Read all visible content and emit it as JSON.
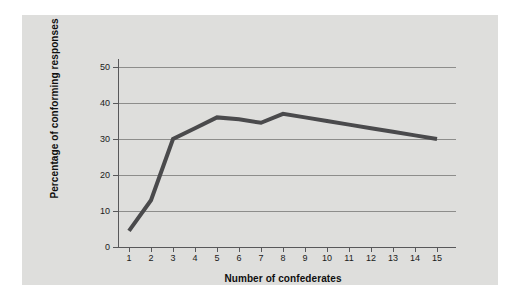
{
  "figure": {
    "panel_background": "#dededc",
    "page_background": "#ffffff"
  },
  "chart_data": {
    "type": "line",
    "title": "",
    "subtitle": "",
    "xlabel": "Number of confederates",
    "ylabel": "Percentage of conforming responses",
    "x": [
      1,
      2,
      3,
      4,
      5,
      6,
      7,
      8,
      9,
      10,
      11,
      12,
      13,
      14,
      15
    ],
    "categories": [
      "1",
      "2",
      "3",
      "4",
      "5",
      "6",
      "7",
      "8",
      "9",
      "10",
      "11",
      "12",
      "13",
      "14",
      "15"
    ],
    "values": [
      4.5,
      13,
      30,
      33,
      36,
      35.5,
      34.5,
      37,
      36,
      35,
      34,
      33,
      32,
      31,
      30
    ],
    "series": [
      {
        "name": "Percentage of conforming responses",
        "values": [
          4.5,
          13,
          30,
          33,
          36,
          35.5,
          34.5,
          37,
          36,
          35,
          34,
          33,
          32,
          31,
          30
        ],
        "color": "#4a4a4c",
        "line_width": 4
      }
    ],
    "xlim": [
      0.5,
      15.5
    ],
    "ylim": [
      0,
      50
    ],
    "yticks": [
      0,
      10,
      20,
      30,
      40,
      50
    ],
    "ytick_labels": [
      "0",
      "10",
      "20",
      "30",
      "40",
      "50"
    ],
    "xticks": [
      1,
      2,
      3,
      4,
      5,
      6,
      7,
      8,
      9,
      10,
      11,
      12,
      13,
      14,
      15
    ],
    "xtick_labels": [
      "1",
      "2",
      "3",
      "4",
      "5",
      "6",
      "7",
      "8",
      "9",
      "10",
      "11",
      "12",
      "13",
      "14",
      "15"
    ],
    "grid": "horizontal",
    "grid_color": "#8d8d8b",
    "axis_color": "#58585a",
    "legend": null,
    "legend_position": "none",
    "annotations": []
  }
}
